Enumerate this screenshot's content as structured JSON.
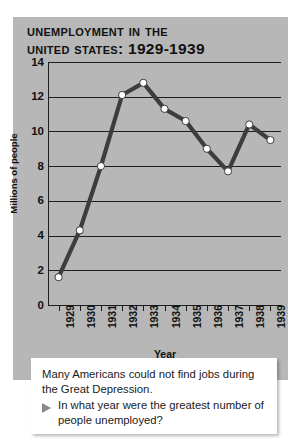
{
  "title_line1": "Unemployment in the",
  "title_line2": "United States: 1929-1939",
  "caption": {
    "statement": "Many Americans could not find jobs during the Great Depression.",
    "question": "In what year were the greatest number of people unemployed?",
    "bullet_icon": "triangle-right-icon"
  },
  "colors": {
    "panel_background": "#b7b7b7",
    "line": "#3d3d3d",
    "marker_fill": "#ffffff",
    "axis": "#1d1d1d",
    "caption_background": "#ffffff"
  },
  "chart_data": {
    "type": "line",
    "title": "Unemployment in the United States: 1929-1939",
    "xlabel": "Year",
    "ylabel": "Millions of people",
    "categories": [
      "1929",
      "1930",
      "1931",
      "1932",
      "1933",
      "1934",
      "1935",
      "1936",
      "1937",
      "1938",
      "1939"
    ],
    "values": [
      1.6,
      4.3,
      8.0,
      12.1,
      12.8,
      11.3,
      10.6,
      9.0,
      7.7,
      10.4,
      9.5
    ],
    "ylim": [
      0,
      14
    ],
    "yticks": [
      0,
      2,
      4,
      6,
      8,
      10,
      12,
      14
    ],
    "ytick_labels": [
      "0",
      "2",
      "4",
      "6",
      "8",
      "10",
      "12",
      "14"
    ],
    "xtick_labels": [
      "1929",
      "1930",
      "1931",
      "1932",
      "1933",
      "1934",
      "1935",
      "1936",
      "1937",
      "1938",
      "1939"
    ],
    "grid": true,
    "grid_axis": "y",
    "legend": false,
    "markers": "circle"
  }
}
